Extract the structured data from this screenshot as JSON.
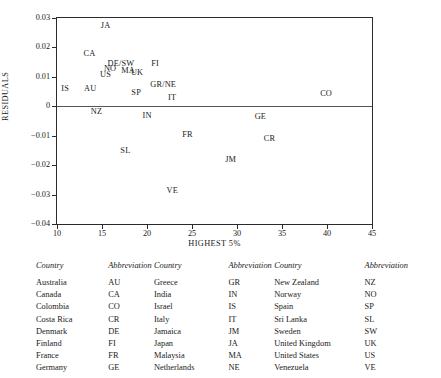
{
  "chart_data": {
    "type": "scatter",
    "title": "",
    "xlabel": "HIGHEST 5%",
    "ylabel": "RESIDUALS",
    "xlim": [
      10,
      45
    ],
    "ylim": [
      -0.04,
      0.03
    ],
    "xticks": [
      "10",
      "15",
      "20",
      "25",
      "30",
      "35",
      "40",
      "45"
    ],
    "yticks": [
      "0.03",
      "0.02",
      "0.01",
      "0",
      "−0.01",
      "−0.02",
      "−0.03",
      "−0.04"
    ],
    "grid": false,
    "legend_position": "none",
    "reference_line": 0,
    "points": [
      {
        "label": "JA",
        "x": 15.4,
        "y": 0.0272
      },
      {
        "label": "CA",
        "x": 13.6,
        "y": 0.0178
      },
      {
        "label": "DE/SW",
        "x": 17.1,
        "y": 0.0145
      },
      {
        "label": "FI",
        "x": 20.9,
        "y": 0.0142
      },
      {
        "label": "NO",
        "x": 15.9,
        "y": 0.0128
      },
      {
        "label": "MA",
        "x": 17.9,
        "y": 0.0119
      },
      {
        "label": "UK",
        "x": 18.9,
        "y": 0.0112
      },
      {
        "label": "US",
        "x": 15.4,
        "y": 0.0105
      },
      {
        "label": "GR/NE",
        "x": 21.8,
        "y": 0.0072
      },
      {
        "label": "IS",
        "x": 10.9,
        "y": 0.0058
      },
      {
        "label": "AU",
        "x": 13.7,
        "y": 0.0058
      },
      {
        "label": "SP",
        "x": 18.8,
        "y": 0.0046
      },
      {
        "label": "CO",
        "x": 39.9,
        "y": 0.0042
      },
      {
        "label": "IT",
        "x": 22.8,
        "y": 0.0028
      },
      {
        "label": "NZ",
        "x": 14.4,
        "y": -0.0018
      },
      {
        "label": "IN",
        "x": 20.0,
        "y": -0.0032
      },
      {
        "label": "GE",
        "x": 32.6,
        "y": -0.0035
      },
      {
        "label": "FR",
        "x": 24.5,
        "y": -0.0097
      },
      {
        "label": "CR",
        "x": 33.6,
        "y": -0.0112
      },
      {
        "label": "SL",
        "x": 17.6,
        "y": -0.0152
      },
      {
        "label": "JM",
        "x": 29.3,
        "y": -0.0183
      },
      {
        "label": "VE",
        "x": 22.8,
        "y": -0.0288
      }
    ]
  },
  "legend_table": {
    "headers": [
      "Country",
      "Abbreviation",
      "Country",
      "Abbreviation",
      "Country",
      "Abbreviation"
    ],
    "rows": [
      [
        "Australia",
        "AU",
        "Greece",
        "GR",
        "New Zealand",
        "NZ"
      ],
      [
        "Canada",
        "CA",
        "India",
        "IN",
        "Norway",
        "NO"
      ],
      [
        "Colombia",
        "CO",
        "Israel",
        "IS",
        "Spain",
        "SP"
      ],
      [
        "Costa Rica",
        "CR",
        "Italy",
        "IT",
        "Sri Lanka",
        "SL"
      ],
      [
        "Denmark",
        "DE",
        "Jamaica",
        "JM",
        "Sweden",
        "SW"
      ],
      [
        "Finland",
        "FI",
        "Japan",
        "JA",
        "United Kingdom",
        "UK"
      ],
      [
        "France",
        "FR",
        "Malaysia",
        "MA",
        "United States",
        "US"
      ],
      [
        "Germany",
        "GE",
        "Netherlands",
        "NE",
        "Venezuela",
        "VE"
      ]
    ]
  },
  "colors": {
    "axis": "#2b2b2b",
    "text": "#1a1a1a",
    "zero_line": "#555555"
  }
}
